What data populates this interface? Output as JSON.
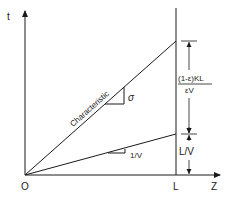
{
  "diagram": {
    "type": "t-z characteristic diagram",
    "axes": {
      "vertical_label": "t",
      "horizontal_label": "Z",
      "origin_label": "O",
      "length_marker_label": "L"
    },
    "lines": [
      {
        "name": "characteristic",
        "label": "Characteristic",
        "slope_label": "σ"
      },
      {
        "name": "fluid-front",
        "label": "",
        "slope_label": "1/V"
      }
    ],
    "dimensions": {
      "upper": {
        "numerator": "(1-ε)KL",
        "denominator": "εV"
      },
      "lower": "L/V"
    },
    "colors": {
      "ink": "#1a1a1a",
      "background": "#ffffff"
    }
  }
}
